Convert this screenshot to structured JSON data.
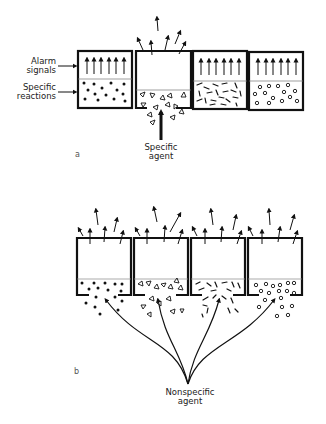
{
  "figure": {
    "panel_a": {
      "letter": "a",
      "labels": {
        "alarm_line1": "Alarm",
        "alarm_line2": "signals",
        "specific_line1": "Specific",
        "specific_line2": "reactions",
        "agent_line1": "Specific",
        "agent_line2": "agent"
      },
      "cells": [
        {
          "particle": "filled-dots",
          "state": "intact",
          "alarm_arrows": 6
        },
        {
          "particle": "open-triangles",
          "state": "ruptured-bottom",
          "alarm_arrows": 0,
          "escaping_arrows": 6
        },
        {
          "particle": "short-dashes",
          "state": "intact",
          "alarm_arrows": 6
        },
        {
          "particle": "open-circles",
          "state": "intact",
          "alarm_arrows": 6
        }
      ]
    },
    "panel_b": {
      "letter": "b",
      "labels": {
        "agent_line1": "Nonspecific",
        "agent_line2": "agent"
      },
      "cells": [
        {
          "particle": "filled-dots",
          "state": "ruptured-bottom",
          "escaping_arrows": 6
        },
        {
          "particle": "open-triangles",
          "state": "ruptured-bottom",
          "escaping_arrows": 6
        },
        {
          "particle": "short-dashes",
          "state": "ruptured-bottom",
          "escaping_arrows": 6
        },
        {
          "particle": "open-circles",
          "state": "ruptured-bottom",
          "escaping_arrows": 6
        }
      ]
    }
  }
}
